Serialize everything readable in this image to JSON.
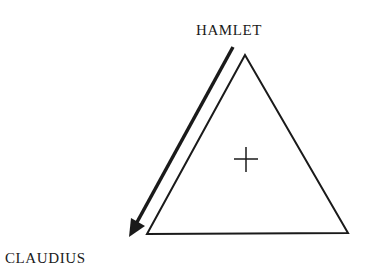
{
  "diagram": {
    "nodes": {
      "top": {
        "label": "HAMLET"
      },
      "bottom_left": {
        "label": "CLAUDIUS"
      }
    },
    "center_symbol": "+",
    "colors": {
      "stroke": "#1a1a1a",
      "background": "#ffffff"
    },
    "edges": [
      {
        "from": "HAMLET",
        "to": "CLAUDIUS",
        "type": "arrow"
      }
    ]
  }
}
